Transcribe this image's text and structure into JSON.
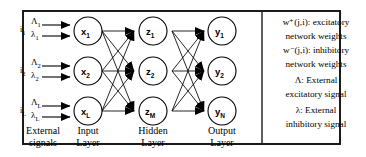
{
  "diagram": {
    "frame": {
      "border_color": "#1a1a1a"
    },
    "external_signals": {
      "groups": [
        {
          "index_label": "i",
          "index_sub": "1",
          "excitatory": "Λ",
          "excitatory_sub": "1",
          "inhibitory": "λ",
          "inhibitory_sub": "1"
        },
        {
          "index_label": "i",
          "index_sub": "2",
          "excitatory": "Λ",
          "excitatory_sub": "2",
          "inhibitory": "λ",
          "inhibitory_sub": "2"
        },
        {
          "index_label": "i",
          "index_sub": "L",
          "excitatory": "Λ",
          "excitatory_sub": "L",
          "inhibitory": "λ",
          "inhibitory_sub": "L"
        }
      ]
    },
    "layers": [
      {
        "name": "input-layer",
        "caption_line1": "Input",
        "caption_line2": "Layer",
        "nodes": [
          {
            "base": "x",
            "sub": "1"
          },
          {
            "base": "x",
            "sub": "2"
          },
          {
            "base": "x",
            "sub": "L"
          }
        ]
      },
      {
        "name": "hidden-layer",
        "caption_line1": "Hidden",
        "caption_line2": "Layer",
        "nodes": [
          {
            "base": "z",
            "sub": "1"
          },
          {
            "base": "z",
            "sub": "2"
          },
          {
            "base": "z",
            "sub": "M"
          }
        ]
      },
      {
        "name": "output-layer",
        "caption_line1": "Output",
        "caption_line2": "Layer",
        "nodes": [
          {
            "base": "y",
            "sub": "1"
          },
          {
            "base": "y",
            "sub": "2"
          },
          {
            "base": "y",
            "sub": "N"
          }
        ]
      }
    ],
    "external_caption": {
      "line1": "External",
      "line2": "signals"
    },
    "legend": {
      "lines": [
        "w⁺(j,i): excitatory",
        "network weights",
        "w⁻(j,i): inhibitory",
        "network weights",
        "Λ: External",
        "excitatory signal",
        "λ: External",
        "inhibitory signal"
      ]
    }
  }
}
